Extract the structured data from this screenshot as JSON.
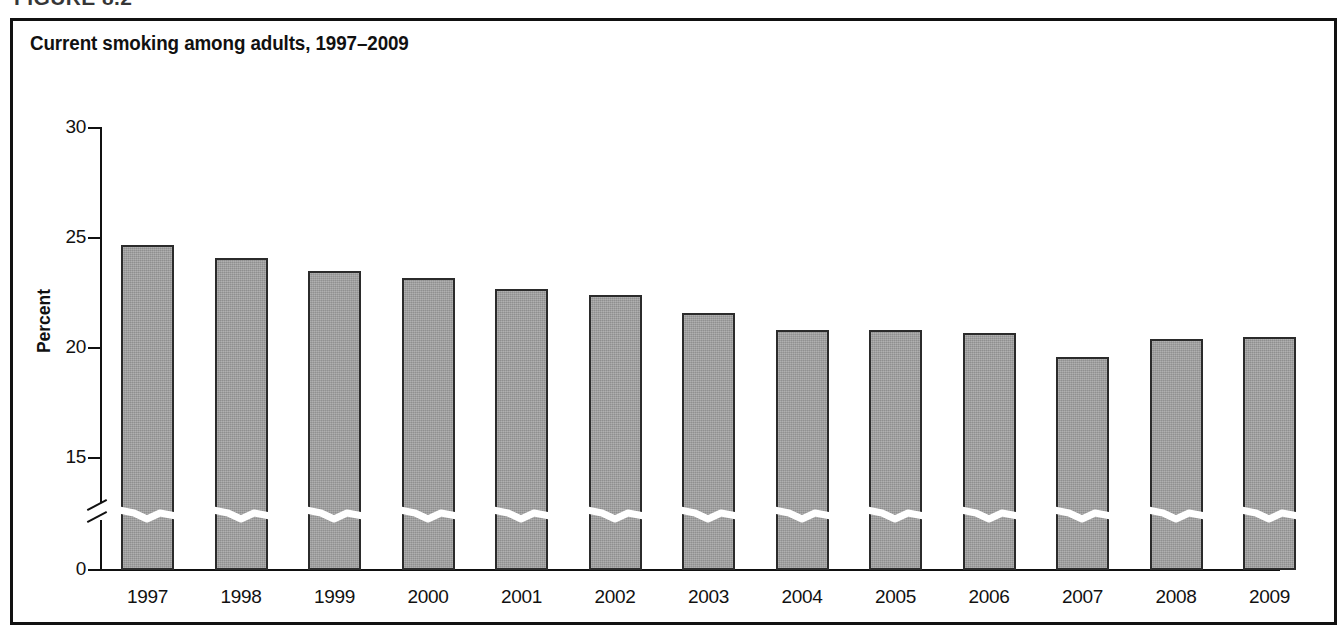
{
  "figure": {
    "heading": "FIGURE 8.2",
    "title": "Current smoking among adults, 1997–2009"
  },
  "chart_data": {
    "type": "bar",
    "title": "Current smoking among adults, 1997–2009",
    "xlabel": "",
    "ylabel": "Percent",
    "categories": [
      "1997",
      "1998",
      "1999",
      "2000",
      "2001",
      "2002",
      "2003",
      "2004",
      "2005",
      "2006",
      "2007",
      "2008",
      "2009"
    ],
    "values": [
      24.7,
      24.1,
      23.5,
      23.2,
      22.7,
      22.4,
      21.6,
      20.8,
      20.8,
      20.7,
      19.6,
      20.4,
      20.5
    ],
    "series": [
      {
        "name": "Current smoking among adults",
        "values": [
          24.7,
          24.1,
          23.5,
          23.2,
          22.7,
          22.4,
          21.6,
          20.8,
          20.8,
          20.7,
          19.6,
          20.4,
          20.5
        ]
      }
    ],
    "ylim": [
      0,
      30
    ],
    "yticks": [
      0,
      15,
      20,
      25,
      30
    ],
    "ytick_labels": [
      "0",
      "15",
      "20",
      "25",
      "30"
    ],
    "axis_break": true,
    "axis_break_note": "y-axis broken between 0 and 15",
    "grid": false,
    "legend": false,
    "bar_color": "#9e9e9e",
    "bar_edge_color": "#2b2b2b"
  }
}
